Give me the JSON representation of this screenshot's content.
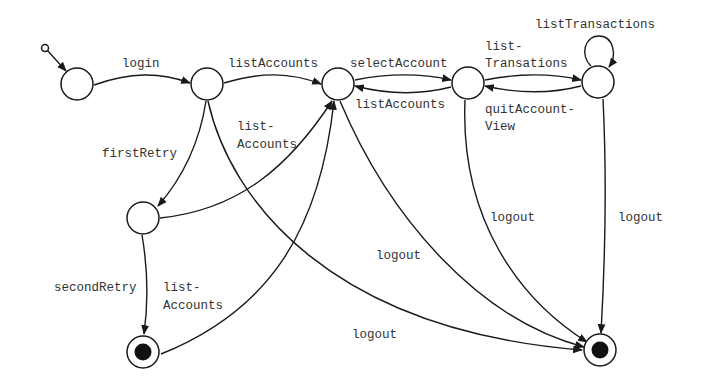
{
  "diagram": {
    "type": "state-machine",
    "colors": {
      "line": "#1a1a1a",
      "text": "#333333",
      "background": "#ffffff"
    },
    "states": [
      {
        "id": "init",
        "kind": "initial-pseudostate"
      },
      {
        "id": "s_start",
        "kind": "state"
      },
      {
        "id": "s_loggedIn",
        "kind": "state"
      },
      {
        "id": "s_accounts",
        "kind": "state"
      },
      {
        "id": "s_account",
        "kind": "state"
      },
      {
        "id": "s_transactions",
        "kind": "state"
      },
      {
        "id": "s_retry",
        "kind": "state"
      },
      {
        "id": "f_left",
        "kind": "final"
      },
      {
        "id": "f_right",
        "kind": "final"
      }
    ],
    "labels": {
      "login": "login",
      "listAccounts_top": "listAccounts",
      "selectAccount": "selectAccount",
      "listAccounts_back": "listAccounts",
      "listTransations_1": "list-",
      "listTransations_2": "Transations",
      "quitAccountView_1": "quitAccount-",
      "quitAccountView_2": "View",
      "listTransactions_loop": "listTransactions",
      "firstRetry": "firstRetry",
      "listAccounts_retry_1": "list-",
      "listAccounts_retry_2": "Accounts",
      "secondRetry": "secondRetry",
      "listAccounts_final_1": "list-",
      "listAccounts_final_2": "Accounts",
      "logout_accounts": "logout",
      "logout_account": "logout",
      "logout_transactions": "logout",
      "logout_loggedIn": "logout"
    },
    "transitions": [
      {
        "from": "init",
        "to": "s_start",
        "label": ""
      },
      {
        "from": "s_start",
        "to": "s_loggedIn",
        "label": "login"
      },
      {
        "from": "s_loggedIn",
        "to": "s_accounts",
        "label": "listAccounts"
      },
      {
        "from": "s_accounts",
        "to": "s_account",
        "label": "selectAccount"
      },
      {
        "from": "s_account",
        "to": "s_accounts",
        "label": "listAccounts"
      },
      {
        "from": "s_account",
        "to": "s_transactions",
        "label": "list-Transations"
      },
      {
        "from": "s_transactions",
        "to": "s_account",
        "label": "quitAccount-View"
      },
      {
        "from": "s_transactions",
        "to": "s_transactions",
        "label": "listTransactions"
      },
      {
        "from": "s_loggedIn",
        "to": "s_retry",
        "label": "firstRetry"
      },
      {
        "from": "s_retry",
        "to": "s_accounts",
        "label": "list-Accounts"
      },
      {
        "from": "s_retry",
        "to": "f_left",
        "label": "secondRetry"
      },
      {
        "from": "f_left",
        "to": "s_accounts",
        "label": "list-Accounts"
      },
      {
        "from": "s_loggedIn",
        "to": "f_right",
        "label": "logout"
      },
      {
        "from": "s_accounts",
        "to": "f_right",
        "label": "logout"
      },
      {
        "from": "s_account",
        "to": "f_right",
        "label": "logout"
      },
      {
        "from": "s_transactions",
        "to": "f_right",
        "label": "logout"
      }
    ]
  }
}
